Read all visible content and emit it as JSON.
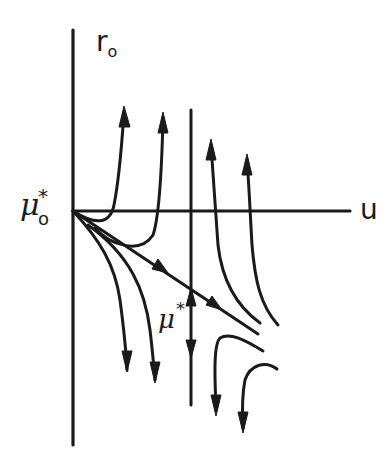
{
  "figure": {
    "type": "phase-portrait",
    "labels": {
      "y_axis": "r",
      "y_axis_subscript": "o",
      "x_axis": "u",
      "fixed_point": "μ",
      "fixed_point_superscript": "*",
      "fixed_point_subscript": "o",
      "separatrix": "μ",
      "separatrix_superscript": "*"
    },
    "colors": {
      "ink": "#1a1a1a",
      "background": "#ffffff"
    },
    "elements": {
      "axes": [
        "vertical r_o axis",
        "horizontal u axis"
      ],
      "vertical_line": "vertical invariant line with arrows pointing away from separatrix (up and down)",
      "separatrix": "straight line from μ*_o descending to the right, arrows pointing away from origin",
      "trajectories_up": 4,
      "trajectories_down": 4
    }
  }
}
